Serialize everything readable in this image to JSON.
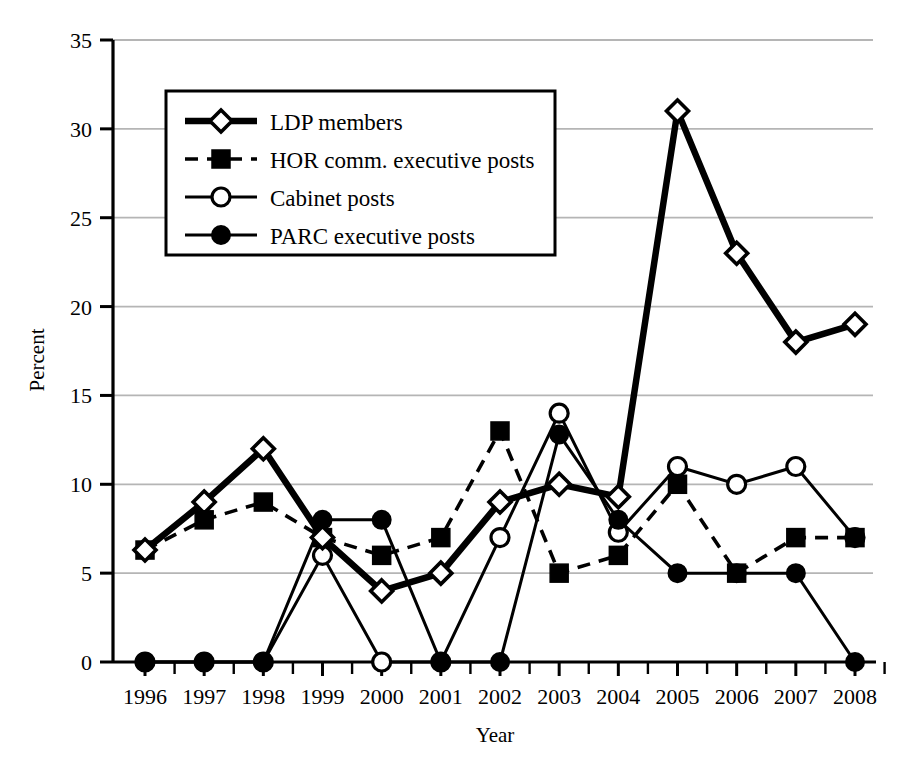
{
  "chart_data": {
    "type": "line",
    "title": "",
    "xlabel": "Year",
    "ylabel": "Percent",
    "categories": [
      "1996",
      "1997",
      "1998",
      "1999",
      "2000",
      "2001",
      "2002",
      "2003",
      "2004",
      "2005",
      "2006",
      "2007",
      "2008"
    ],
    "x": [
      1996,
      1997,
      1998,
      1999,
      2000,
      2001,
      2002,
      2003,
      2004,
      2005,
      2006,
      2007,
      2008
    ],
    "xlim": [
      1996,
      2008
    ],
    "ylim": [
      0,
      35
    ],
    "yticks": [
      0,
      5,
      10,
      15,
      20,
      25,
      30,
      35
    ],
    "xticks": [
      "1996",
      "1997",
      "1998",
      "1999",
      "2000",
      "2001",
      "2002",
      "2003",
      "2004",
      "2005",
      "2006",
      "2007",
      "2008"
    ],
    "grid": "horizontal",
    "legend_position": "upper-left-inside",
    "series": [
      {
        "name": "LDP members",
        "marker": "open-diamond",
        "line": "solid-thick",
        "color": "#000000",
        "values": [
          6.3,
          9,
          12,
          7,
          4,
          5,
          9,
          10,
          9.3,
          31,
          23,
          18,
          19
        ]
      },
      {
        "name": "HOR comm. executive posts",
        "marker": "filled-square",
        "line": "dashed",
        "color": "#000000",
        "values": [
          6.3,
          8,
          9,
          7,
          6,
          7,
          13,
          5,
          6,
          10,
          5,
          7,
          7
        ]
      },
      {
        "name": "Cabinet posts",
        "marker": "open-circle",
        "line": "solid-thin",
        "color": "#000000",
        "values": [
          0,
          0,
          0,
          6,
          0,
          0,
          7,
          14,
          7.3,
          11,
          10,
          11,
          7
        ]
      },
      {
        "name": "PARC executive posts",
        "marker": "filled-circle",
        "line": "solid-thin",
        "color": "#000000",
        "values": [
          0,
          0,
          0,
          8,
          8,
          0,
          0,
          12.8,
          8,
          5,
          5,
          5,
          0
        ]
      }
    ]
  },
  "axes": {
    "y_title": "Percent",
    "x_title": "Year",
    "y_tick_labels": [
      "0",
      "5",
      "10",
      "15",
      "20",
      "25",
      "30",
      "35"
    ],
    "x_tick_labels": [
      "1996",
      "1997",
      "1998",
      "1999",
      "2000",
      "2001",
      "2002",
      "2003",
      "2004",
      "2005",
      "2006",
      "2007",
      "2008"
    ]
  },
  "legend": {
    "items": [
      {
        "label": "LDP members",
        "marker": "open-diamond",
        "line": "solid-thick"
      },
      {
        "label": "HOR comm. executive posts",
        "marker": "filled-square",
        "line": "dashed"
      },
      {
        "label": "Cabinet posts",
        "marker": "open-circle",
        "line": "solid-thin"
      },
      {
        "label": "PARC executive posts",
        "marker": "filled-circle",
        "line": "solid-thin"
      }
    ]
  },
  "colors": {
    "ink": "#000000",
    "gridline": "#b5b5b5",
    "background": "#ffffff"
  }
}
